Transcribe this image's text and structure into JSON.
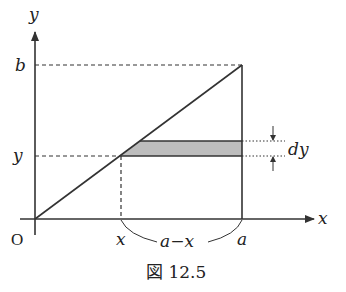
{
  "figure": {
    "caption": "図 12.5",
    "axes": {
      "x_label": "x",
      "y_label": "y",
      "origin_label": "O"
    },
    "labels": {
      "b": "b",
      "y": "y",
      "x": "x",
      "a": "a",
      "a_minus_x": "a−x",
      "dy": "dy"
    },
    "colors": {
      "line": "#333333",
      "strip_fill": "#bdbdbd",
      "background": "#ffffff"
    }
  }
}
